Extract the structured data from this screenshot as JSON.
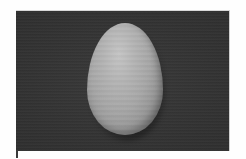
{
  "image": {
    "subject": "egg",
    "description": "Grayscale photograph of a single egg standing upright on a dark textured background",
    "colors": {
      "background": "#333333",
      "egg_highlight": "#c4c4c4",
      "egg_midtone": "#a6a6a6",
      "egg_shadow": "#5a5a5a",
      "page": "#fefefe"
    }
  }
}
